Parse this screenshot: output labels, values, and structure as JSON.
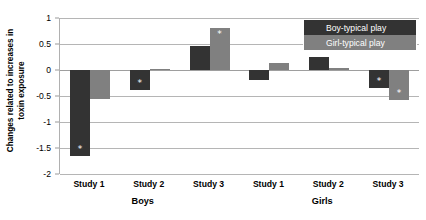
{
  "chart_data": {
    "type": "bar",
    "title": "",
    "subtitle": "",
    "xlabel": "",
    "ylabel": "Changes related to increases in toxin exposure",
    "ylabel_line1": "Changes related to increases in",
    "ylabel_line2": "toxin exposure",
    "ylim": [
      -2,
      1
    ],
    "yticks": [
      1,
      0.5,
      0,
      -0.5,
      -1,
      -1.5,
      -2
    ],
    "ytick_labels": [
      "1",
      "0.5",
      "0",
      "-0.5",
      "-1",
      "-1.5",
      "-2"
    ],
    "grid": true,
    "legend_position": "top-right",
    "categories": [
      "Study 1",
      "Study 2",
      "Study 3",
      "Study 1",
      "Study 2",
      "Study 3"
    ],
    "groups": [
      {
        "label": "Boys",
        "categories": [
          "Study 1",
          "Study 2",
          "Study 3"
        ]
      },
      {
        "label": "Girls",
        "categories": [
          "Study 1",
          "Study 2",
          "Study 3"
        ]
      }
    ],
    "series": [
      {
        "name": "Boy-typical play",
        "color": "#333333",
        "values": [
          -1.65,
          -0.38,
          0.47,
          -0.2,
          0.25,
          -0.35
        ],
        "significance": [
          true,
          true,
          false,
          false,
          false,
          true
        ]
      },
      {
        "name": "Girl-typical play",
        "color": "#808080",
        "values": [
          -0.55,
          0.02,
          0.8,
          0.13,
          0.03,
          -0.57
        ],
        "significance": [
          false,
          false,
          true,
          false,
          false,
          true
        ]
      }
    ],
    "significance_marker": "*"
  },
  "legend": {
    "items": [
      {
        "label": "Boy-typical play",
        "color": "#333333"
      },
      {
        "label": "Girl-typical play",
        "color": "#808080"
      }
    ]
  },
  "axes": {
    "y_title_line1": "Changes related to increases in",
    "y_title_line2": "toxin exposure",
    "y_ticks": [
      "1",
      "0.5",
      "0",
      "-0.5",
      "-1",
      "-1.5",
      "-2"
    ],
    "x_ticks": [
      "Study 1",
      "Study 2",
      "Study 3",
      "Study 1",
      "Study 2",
      "Study 3"
    ],
    "x_groups": [
      "Boys",
      "Girls"
    ]
  }
}
